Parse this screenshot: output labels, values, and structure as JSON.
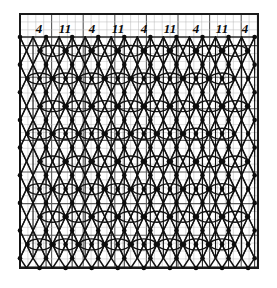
{
  "document": {
    "type": "bobbin-lace-pricking-diagram",
    "title": "",
    "background_color": "#ffffff",
    "ink_color": "#111111"
  },
  "frame": {
    "x": 20,
    "y": 14,
    "width": 238,
    "height": 254,
    "border_color": "#1a1a1a",
    "border_width": 2
  },
  "grid": {
    "cell_size": 7.9,
    "minor_color": "#b9b9b9",
    "major_color": "#5a5a5a",
    "major_every": 4,
    "minor_width": 0.5,
    "major_width": 1.1,
    "columns": 30,
    "rows": 32,
    "visible": true
  },
  "header": {
    "label": "thread/pair count row",
    "baseline_y": 33,
    "separator_y": 37,
    "numbers": [
      {
        "text": "4",
        "x": 39
      },
      {
        "text": "11",
        "x": 65
      },
      {
        "text": "4",
        "x": 92
      },
      {
        "text": "11",
        "x": 118
      },
      {
        "text": "4",
        "x": 144
      },
      {
        "text": "11",
        "x": 170
      },
      {
        "text": "4",
        "x": 196
      },
      {
        "text": "11",
        "x": 222
      },
      {
        "text": "4",
        "x": 245
      }
    ],
    "sequence_text": "4 11 4 11 4 11 4 11 4"
  },
  "pattern": {
    "name": "torchon-ground-with-tallies",
    "repeat_width": 52,
    "repeat_height": 56,
    "stroke_color": "#121212",
    "thread_stroke_width": 1.5,
    "pin_dot_radius": 2.3,
    "pin_dot_color": "#0d0d0d",
    "tally_rx": 12,
    "tally_ry": 5.5,
    "tally_stroke_width": 1.4,
    "description": "Diagonal crossing thread paths forming a net ground, with horizontal oval leaf/tally motifs placed at alternating lattice intersections; pin positions marked by filled dots."
  }
}
